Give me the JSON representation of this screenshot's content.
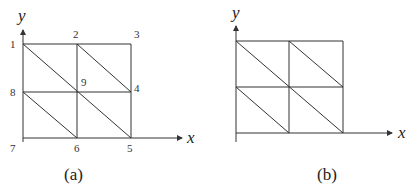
{
  "figures": [
    {
      "id": "a",
      "caption": "(a)",
      "axes": {
        "x_label": "x",
        "y_label": "y"
      },
      "nodes": [
        {
          "id": "1",
          "label": "1"
        },
        {
          "id": "2",
          "label": "2"
        },
        {
          "id": "3",
          "label": "3"
        },
        {
          "id": "4",
          "label": "4"
        },
        {
          "id": "5",
          "label": "5"
        },
        {
          "id": "6",
          "label": "6"
        },
        {
          "id": "7",
          "label": "7"
        },
        {
          "id": "8",
          "label": "8"
        },
        {
          "id": "9",
          "label": "9"
        }
      ],
      "mesh": "2x2 square grid, each square split by a diagonal from top-left to bottom-right into 8 triangles"
    },
    {
      "id": "b",
      "caption": "(b)",
      "axes": {
        "x_label": "x",
        "y_label": "y"
      },
      "mesh": "2x2 square grid, each square split by a diagonal from top-left to bottom-right into 8 triangles (unlabeled)"
    }
  ]
}
